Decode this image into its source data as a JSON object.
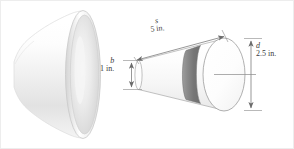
{
  "figure": {
    "background_color": "#ffffff",
    "border_color": "#e8e8e8",
    "line_color": "#6b6b6b",
    "text_color": "#3a3a3a",
    "shading": {
      "band_dark": "#7f7f7f",
      "band_mid": "#9a9a9a",
      "body_light": "#fbfbfb",
      "body_shadow": "#d8d8d8",
      "horn_light": "#ffffff",
      "horn_shadow": "#cfcfcf",
      "rim_color": "#c9c9c9"
    }
  },
  "objects": [
    {
      "name": "horn",
      "label": "bell / horn solid of revolution",
      "description": "flared bell shape with large elliptical opening facing right"
    },
    {
      "name": "frustum",
      "label": "truncated cone",
      "description": "small circular end at left, large circular end at right with dark shaded band"
    }
  ],
  "dimensions": [
    {
      "id": "slant",
      "symbol": "s",
      "value": "5 in.",
      "kind": "slant-height",
      "orientation": "diagonal"
    },
    {
      "id": "small-diameter",
      "symbol": "b",
      "value": "1 in.",
      "kind": "diameter",
      "orientation": "vertical"
    },
    {
      "id": "large-diameter",
      "symbol": "d",
      "value": "2.5 in.",
      "kind": "diameter",
      "orientation": "vertical"
    }
  ]
}
